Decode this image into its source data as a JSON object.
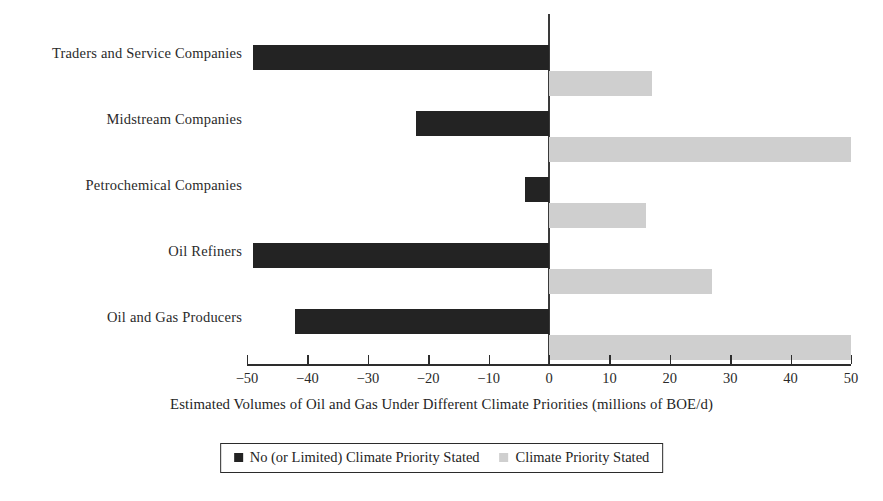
{
  "chart_data": {
    "type": "bar",
    "orientation": "horizontal",
    "title": "",
    "xlabel": "Estimated Volumes of Oil and Gas Under Different Climate Priorities (millions of BOE/d)",
    "ylabel": "",
    "categories": [
      "Traders and Service Companies",
      "Midstream Companies",
      "Petrochemical Companies",
      "Oil Refiners",
      "Oil and Gas Producers"
    ],
    "series": [
      {
        "name": "No (or Limited) Climate Priority Stated",
        "color": "#232323",
        "values": [
          -49,
          -22,
          -4,
          -49,
          -42
        ]
      },
      {
        "name": "Climate Priority Stated",
        "color": "#cfcfcf",
        "values": [
          17,
          50,
          16,
          27,
          50
        ]
      }
    ],
    "xlim": [
      -50,
      50
    ],
    "xticks": [
      -50,
      -40,
      -30,
      -20,
      -10,
      0,
      10,
      20,
      30,
      40,
      50
    ],
    "xticklabels": [
      "−50",
      "−40",
      "−30",
      "−20",
      "−10",
      "0",
      "10",
      "20",
      "30",
      "40",
      "50"
    ],
    "grid": false,
    "legend_position": "bottom",
    "zero_line": 0
  },
  "legend": {
    "items": [
      {
        "label": "No (or Limited) Climate Priority Stated",
        "color": "#232323"
      },
      {
        "label": "Climate Priority Stated",
        "color": "#cfcfcf"
      }
    ]
  }
}
